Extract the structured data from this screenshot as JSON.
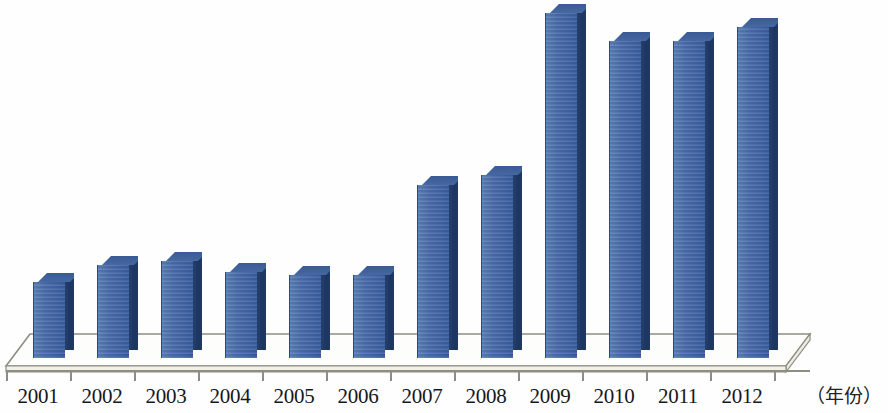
{
  "chart_data": {
    "type": "bar",
    "title": "",
    "subtitle": "",
    "xlabel": "（年份）",
    "ylabel": "",
    "grid": false,
    "legend": null,
    "axis_visible": {
      "x": true,
      "y": false
    },
    "style": "3d-column",
    "categories": [
      "2001",
      "2002",
      "2003",
      "2004",
      "2005",
      "2006",
      "2007",
      "2008",
      "2009",
      "2010",
      "2011",
      "2012"
    ],
    "values": [
      22,
      27,
      28,
      25,
      24,
      24,
      50,
      53,
      100,
      92,
      92,
      96
    ],
    "value_unit": "relative (max = 100)",
    "colors": {
      "bar_front": "#4a6cab",
      "bar_side": "#1d3560",
      "bar_top": "#41629c",
      "axis": "#8d8d84",
      "background": "#ffffff",
      "label_text": "#18181a"
    },
    "ylim": [
      0,
      104
    ]
  },
  "axis": {
    "x_title": "（年份）",
    "tick_count": 13
  },
  "labels": {
    "y2001": "2001",
    "y2002": "2002",
    "y2003": "2003",
    "y2004": "2004",
    "y2005": "2005",
    "y2006": "2006",
    "y2007": "2007",
    "y2008": "2008",
    "y2009": "2009",
    "y2010": "2010",
    "y2011": "2011",
    "y2012": "2012"
  }
}
